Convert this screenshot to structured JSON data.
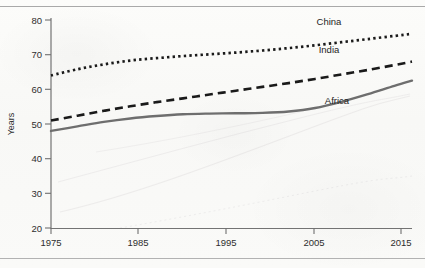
{
  "page": {
    "background_color": "#fbfbf9",
    "rule_color": "#a9a9a9"
  },
  "labels": {
    "china": "China",
    "india": "India",
    "africa": "Africa",
    "ylabel": "Years"
  },
  "axis": {
    "y_ticks": [
      "20",
      "30",
      "40",
      "50",
      "60",
      "70",
      "80"
    ],
    "x_ticks": [
      "1975",
      "1985",
      "1995",
      "2005",
      "2015"
    ]
  },
  "chart_data": {
    "type": "line",
    "title": "",
    "xlabel": "",
    "ylabel": "Years",
    "xlim": [
      1975,
      2016
    ],
    "ylim": [
      20,
      80
    ],
    "grid": false,
    "legend": "inline-annotations",
    "x": [
      1975,
      1978,
      1981,
      1984,
      1987,
      1990,
      1993,
      1996,
      1999,
      2002,
      2005,
      2008,
      2011,
      2014,
      2016
    ],
    "series": [
      {
        "name": "China",
        "style": "dotted",
        "color": "#1a1a1a",
        "values": [
          64.0,
          65.8,
          67.2,
          68.3,
          69.0,
          69.6,
          70.1,
          70.6,
          71.2,
          71.9,
          72.7,
          73.6,
          74.5,
          75.4,
          76.0
        ]
      },
      {
        "name": "India",
        "style": "dashed",
        "color": "#1a1a1a",
        "values": [
          51.0,
          52.4,
          53.8,
          55.1,
          56.3,
          57.4,
          58.5,
          59.6,
          60.7,
          61.8,
          63.0,
          64.3,
          65.6,
          67.0,
          68.0
        ]
      },
      {
        "name": "Africa",
        "style": "solid",
        "color": "#6e6e6e",
        "values": [
          48.0,
          49.3,
          50.6,
          51.6,
          52.3,
          52.8,
          53.0,
          53.1,
          53.2,
          53.6,
          54.6,
          56.4,
          58.6,
          61.0,
          62.5
        ]
      }
    ],
    "annotations": [
      {
        "text": "China",
        "x": 2006,
        "y": 78.3
      },
      {
        "text": "India",
        "x": 2006,
        "y": 70.2
      },
      {
        "text": "Africa",
        "x": 2007,
        "y": 55.6
      }
    ]
  }
}
